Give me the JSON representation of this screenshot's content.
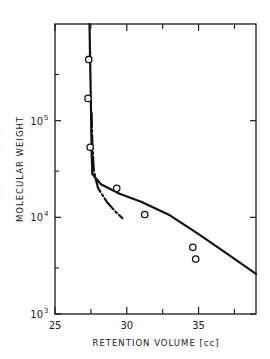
{
  "chart_data": {
    "type": "line",
    "title": "",
    "xlabel": "RETENTION VOLUME [cc]",
    "ylabel": "MOLECULAR WEIGHT",
    "xlim": [
      25,
      39
    ],
    "ylim": [
      1000,
      1000000
    ],
    "yscale": "log",
    "grid": false,
    "legend": null,
    "x_ticks": [
      {
        "value": 25,
        "label": "25"
      },
      {
        "value": 30,
        "label": "30"
      },
      {
        "value": 35,
        "label": "35"
      }
    ],
    "x_minor_ticks": [
      27.5,
      32.5,
      37.5
    ],
    "y_ticks": [
      {
        "value": 1000,
        "label": "10",
        "exp": "3"
      },
      {
        "value": 10000,
        "label": "10",
        "exp": "4"
      },
      {
        "value": 100000,
        "label": "10",
        "exp": "5"
      }
    ],
    "y_minor_ticks": [
      3000,
      30000,
      300000
    ],
    "series": [
      {
        "name": "measured points",
        "style": "open-circle",
        "points": [
          {
            "x": 27.35,
            "y": 430000
          },
          {
            "x": 27.3,
            "y": 170000
          },
          {
            "x": 27.45,
            "y": 53000
          },
          {
            "x": 29.3,
            "y": 20000
          },
          {
            "x": 31.25,
            "y": 10700
          },
          {
            "x": 34.6,
            "y": 4900
          },
          {
            "x": 34.8,
            "y": 3700
          }
        ]
      },
      {
        "name": "solid calibration curve",
        "style": "solid",
        "points": [
          {
            "x": 27.4,
            "y": 1000000
          },
          {
            "x": 27.5,
            "y": 150000
          },
          {
            "x": 27.55,
            "y": 50000
          },
          {
            "x": 27.6,
            "y": 28000
          },
          {
            "x": 28.2,
            "y": 22000
          },
          {
            "x": 29.5,
            "y": 17500
          },
          {
            "x": 31.0,
            "y": 14500
          },
          {
            "x": 33.0,
            "y": 10500
          },
          {
            "x": 35.0,
            "y": 6700
          },
          {
            "x": 37.0,
            "y": 4200
          },
          {
            "x": 39.0,
            "y": 2600
          }
        ]
      },
      {
        "name": "dash-dot calibration curve",
        "style": "dash-dot",
        "points": [
          {
            "x": 27.55,
            "y": 120000
          },
          {
            "x": 27.6,
            "y": 60000
          },
          {
            "x": 27.7,
            "y": 30000
          },
          {
            "x": 28.0,
            "y": 20000
          },
          {
            "x": 28.6,
            "y": 14500
          },
          {
            "x": 29.2,
            "y": 11500
          },
          {
            "x": 29.7,
            "y": 9800
          }
        ]
      }
    ]
  }
}
